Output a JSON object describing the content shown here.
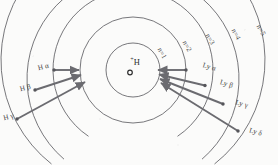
{
  "figure": {
    "mirrored": true,
    "background_color": "#fbfbfa",
    "line_color": "#55555a",
    "transition_color": "#6b6b70",
    "text_color": "#3a3a3a"
  },
  "nucleus": {
    "label": "H",
    "charge": "+",
    "symbol_name": "proton-dot",
    "center_x": 145,
    "center_y": 70
  },
  "orbits": [
    {
      "label": "n=1",
      "n": 1,
      "radius": 27,
      "label_x": 116,
      "label_y": 47,
      "label_rot": -62
    },
    {
      "label": "n=2",
      "n": 2,
      "radius": 53,
      "label_x": 91,
      "label_y": 40,
      "label_rot": -62
    },
    {
      "label": "n=3",
      "n": 3,
      "radius": 80,
      "label_x": 68,
      "label_y": 33,
      "label_rot": -62
    },
    {
      "label": "n=4",
      "n": 4,
      "radius": 106,
      "label_x": 42,
      "label_y": 28,
      "label_rot": -62
    },
    {
      "label": "n=5",
      "n": 5,
      "radius": 132,
      "label_x": 17,
      "label_y": 24,
      "label_rot": -62
    }
  ],
  "series": [
    {
      "name": "Lyman",
      "final_level": 1,
      "side": "left",
      "transitions": [
        {
          "label": "Ly α",
          "greek": "α",
          "from_n": 2,
          "to_n": 1,
          "label_x": 62,
          "label_y": 66,
          "label_rot": -16
        },
        {
          "label": "Ly β",
          "greek": "β",
          "from_n": 3,
          "to_n": 1,
          "label_x": 45,
          "label_y": 83,
          "label_rot": -16
        },
        {
          "label": "Ly γ",
          "greek": "γ",
          "from_n": 4,
          "to_n": 1,
          "label_x": 30,
          "label_y": 103,
          "label_rot": -16
        },
        {
          "label": "Ly δ",
          "greek": "δ",
          "from_n": 5,
          "to_n": 1,
          "label_x": 16,
          "label_y": 131,
          "label_rot": -16
        }
      ]
    },
    {
      "name": "Balmer",
      "final_level": 2,
      "side": "right",
      "transitions": [
        {
          "label": "H α",
          "greek": "α",
          "from_n": 3,
          "to_n": 2,
          "label_x": 211,
          "label_y": 65,
          "label_rot": 14
        },
        {
          "label": "H β",
          "greek": "β",
          "from_n": 4,
          "to_n": 2,
          "label_x": 225,
          "label_y": 86,
          "label_rot": 14
        },
        {
          "label": "H γ",
          "greek": "γ",
          "from_n": 5,
          "to_n": 2,
          "label_x": 241,
          "label_y": 115,
          "label_rot": 14
        }
      ]
    }
  ]
}
